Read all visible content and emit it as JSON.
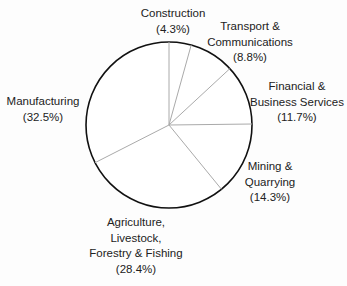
{
  "chart_data": {
    "type": "pie",
    "title": "",
    "start_angle_deg": 0,
    "direction": "clockwise",
    "slices": [
      {
        "label": "Construction",
        "value": 4.3
      },
      {
        "label": "Transport & Communications",
        "value": 8.8
      },
      {
        "label": "Financial & Business Services",
        "value": 11.7
      },
      {
        "label": "Mining & Quarrying",
        "value": 14.3
      },
      {
        "label": "Agriculture, Livestock, Forestry & Fishing",
        "value": 28.4
      },
      {
        "label": "Manufacturing",
        "value": 32.5
      }
    ],
    "legend": "none",
    "colors": {
      "outline": "#111111",
      "divider": "#aaaaaa",
      "fill": "#ffffff"
    }
  },
  "labels": {
    "construction": {
      "lines": [
        "Construction",
        "(4.3%)"
      ]
    },
    "transport": {
      "lines": [
        "Transport &",
        "Communications",
        "(8.8%)"
      ]
    },
    "financial": {
      "lines": [
        "Financial &",
        "Business Services",
        "(11.7%)"
      ]
    },
    "mining": {
      "lines": [
        "Mining &",
        "Quarrying",
        "(14.3%)"
      ]
    },
    "agriculture": {
      "lines": [
        "Agriculture,",
        "Livestock,",
        "Forestry & Fishing",
        "(28.4%)"
      ]
    },
    "manufacturing": {
      "lines": [
        "Manufacturing",
        "(32.5%)"
      ]
    }
  }
}
